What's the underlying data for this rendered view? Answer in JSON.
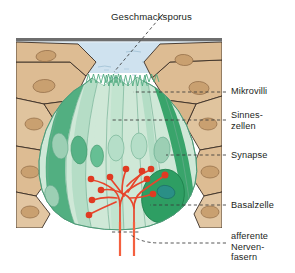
{
  "figure": {
    "title": "Geschmacksporus",
    "language": "de"
  },
  "labels": [
    {
      "id": "geschmacksporus",
      "text": "Geschmacksporus",
      "x": 111,
      "y": 11
    },
    {
      "id": "mikrovilli",
      "text": "Mikrovilli",
      "x": 231,
      "y": 89
    },
    {
      "id": "sinneszellen",
      "text": "Sinnes-\nzellen",
      "x": 231,
      "y": 112
    },
    {
      "id": "synapse",
      "text": "Synapse",
      "x": 231,
      "y": 151
    },
    {
      "id": "basalzelle",
      "text": "Basalzelle",
      "x": 231,
      "y": 201
    },
    {
      "id": "nervenfasern",
      "text": "afferente\nNerven-\nfasern",
      "x": 231,
      "y": 233
    }
  ],
  "colors": {
    "surface_line": "#6e6e6e",
    "fluid": "#cfe2ef",
    "epithelium_fill": "#ddbc93",
    "epithelium_stroke": "#3b2f26",
    "epithelium_nucleus": "#c9a070",
    "taste_bud_light": "#cfe8d8",
    "taste_bud_mid": "#a9d9bf",
    "taste_bud_dark": "#4cad7c",
    "taste_bud_darker": "#2e9e63",
    "nucleus_green": "#9ccfb4",
    "nucleus_teal": "#2a8f86",
    "nerve": "#e8452c",
    "nerve_trunk": "#f4603f",
    "label_text": "#231f1d",
    "leader": "#3a3a3a"
  },
  "anatomy": {
    "sensory_cells_count": 9,
    "synapse_terminals": 9,
    "nerve_trunks": 2,
    "microvilli_tufts": 2
  }
}
